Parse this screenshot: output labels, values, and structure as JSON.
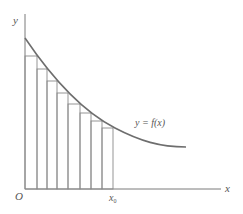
{
  "diagram": {
    "axes": {
      "x_label": "x",
      "y_label": "y",
      "origin_label": "O"
    },
    "curve_label": "y = f(x)",
    "point_label": {
      "base": "x",
      "subscript": "0"
    },
    "rectangles": {
      "count": 8,
      "type": "inscribed lower sums under decreasing curve",
      "x_edges": [
        25,
        37,
        47,
        57,
        68,
        80,
        91,
        102,
        113
      ],
      "tops": [
        56,
        69,
        81,
        93,
        104,
        113,
        121,
        128
      ]
    },
    "colors": {
      "axis": "#7a7a7a",
      "curve": "#6e6e6e",
      "rectangles": "#8a8a8a",
      "text": "#555555"
    }
  }
}
